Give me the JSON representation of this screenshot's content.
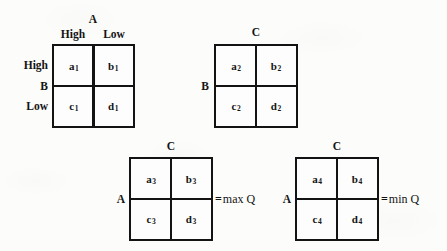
{
  "figure": {
    "title": "",
    "ink_color": "#131313",
    "paper_color": "#fcfcfb"
  },
  "matrices": [
    {
      "id": "matrix-1",
      "column_axis_label": "A",
      "column_headers": [
        "High",
        "Low"
      ],
      "row_axis_label": "B",
      "row_headers": [
        "High",
        "Low"
      ],
      "cells": {
        "top_left": "a",
        "top_left_sub": "1",
        "top_right": "b",
        "top_right_sub": "1",
        "bottom_left": "c",
        "bottom_left_sub": "1",
        "bottom_right": "d",
        "bottom_right_sub": "1"
      },
      "result": ""
    },
    {
      "id": "matrix-2",
      "column_axis_label": "C",
      "column_headers": [
        "",
        ""
      ],
      "row_axis_label": "B",
      "row_headers": [
        "",
        ""
      ],
      "cells": {
        "top_left": "a",
        "top_left_sub": "2",
        "top_right": "b",
        "top_right_sub": "2",
        "bottom_left": "c",
        "bottom_left_sub": "2",
        "bottom_right": "d",
        "bottom_right_sub": "2"
      },
      "result": ""
    },
    {
      "id": "matrix-3",
      "column_axis_label": "C",
      "column_headers": [
        "",
        ""
      ],
      "row_axis_label": "A",
      "row_headers": [
        "",
        ""
      ],
      "cells": {
        "top_left": "a",
        "top_left_sub": "3",
        "top_right": "b",
        "top_right_sub": "3",
        "bottom_left": "c",
        "bottom_left_sub": "3",
        "bottom_right": "d",
        "bottom_right_sub": "3"
      },
      "result_equals": "=",
      "result": "max Q"
    },
    {
      "id": "matrix-4",
      "column_axis_label": "C",
      "column_headers": [
        "",
        ""
      ],
      "row_axis_label": "A",
      "row_headers": [
        "",
        ""
      ],
      "cells": {
        "top_left": "a",
        "top_left_sub": "4",
        "top_right": "b",
        "top_right_sub": "4",
        "bottom_left": "c",
        "bottom_left_sub": "4",
        "bottom_right": "d",
        "bottom_right_sub": "4"
      },
      "result_equals": "=",
      "result": "min Q"
    }
  ]
}
